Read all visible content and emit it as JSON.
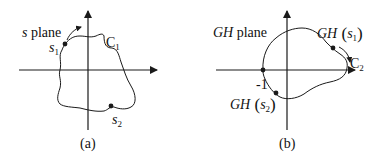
{
  "panels": [
    {
      "id": "a",
      "caption": "(a)",
      "plane_label": {
        "var": "s",
        "text": " plane"
      },
      "contour_label": {
        "main": "C",
        "sub": "1"
      },
      "points": [
        {
          "name": "s1",
          "var": "s",
          "sub": "1"
        },
        {
          "name": "s2",
          "var": "s",
          "sub": "2"
        }
      ]
    },
    {
      "id": "b",
      "caption": "(b)",
      "plane_label": {
        "var": "GH",
        "text": " plane"
      },
      "contour_label": {
        "main": "C",
        "sub": "2"
      },
      "critical_point": "-1",
      "points": [
        {
          "name": "GH(s1)",
          "fn": "GH",
          "var": "s",
          "sub": "1"
        },
        {
          "name": "GH(s2)",
          "fn": "GH",
          "var": "s",
          "sub": "2"
        }
      ]
    }
  ],
  "colors": {
    "line": "#1a1a1a",
    "background": "#ffffff"
  }
}
